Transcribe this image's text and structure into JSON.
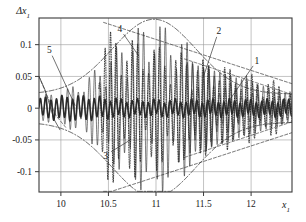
{
  "chart_data": {
    "type": "line",
    "title": "",
    "xlabel": "x1",
    "ylabel": "Δx1",
    "xlim": [
      9.77,
      12.43
    ],
    "ylim": [
      -0.132,
      0.142
    ],
    "grid": true,
    "legend_position": "inline-annotations",
    "xticks": [
      10,
      10.5,
      11,
      11.5,
      12
    ],
    "xtick_labels": [
      "10",
      "10.5",
      "11",
      "11.5",
      "12"
    ],
    "yticks": [
      -0.1,
      -0.05,
      0,
      0.05,
      0.1
    ],
    "ytick_labels": [
      "-0.1",
      "-0.05",
      "0",
      "0.05",
      "0.1"
    ],
    "annotations": [
      {
        "text": "1",
        "x": 12.06,
        "y": 0.075,
        "leader_to_x": 11.77,
        "leader_to_y": 0.012
      },
      {
        "text": "2",
        "x": 11.66,
        "y": 0.122,
        "leader_to_x": 11.5,
        "leader_to_y": 0.05
      },
      {
        "text": "3",
        "x": 10.47,
        "y": -0.074,
        "leader_to_x": 10.73,
        "leader_to_y": -0.05
      },
      {
        "text": "4",
        "x": 10.62,
        "y": 0.125,
        "leader_to_x": 10.82,
        "leader_to_y": 0.082
      },
      {
        "text": "5",
        "x": 9.88,
        "y": 0.092,
        "leader_to_x": 10.15,
        "leader_to_y": 0.004
      }
    ],
    "series": [
      {
        "name": "1",
        "style": "solid-thin",
        "description": "decaying oscillation right side"
      },
      {
        "name": "2",
        "style": "dashed",
        "description": "descending envelope right"
      },
      {
        "name": "3",
        "style": "dash-dot",
        "description": "lower beat envelope"
      },
      {
        "name": "4",
        "style": "dash-dot",
        "description": "upper beat envelope"
      },
      {
        "name": "5",
        "style": "solid-thick",
        "description": "high-frequency carrier near zero"
      }
    ],
    "colors": {
      "axis": "#3a3a3a",
      "grid": "#9a9a9a",
      "curve": "#2a2a2a",
      "background": "#ffffff"
    }
  }
}
